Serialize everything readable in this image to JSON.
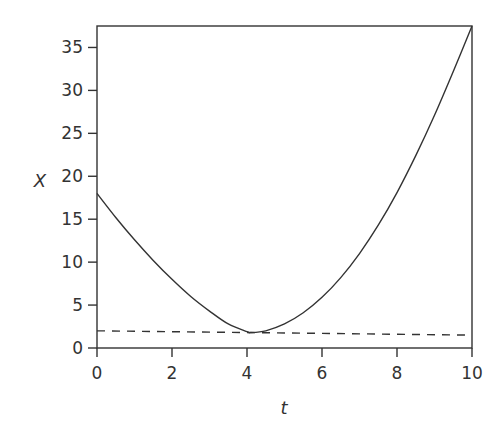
{
  "chart_data": {
    "type": "line",
    "title": "",
    "xlabel": "t",
    "ylabel": "X",
    "xlim": [
      0,
      10
    ],
    "ylim": [
      0,
      37.5
    ],
    "grid": false,
    "legend": null,
    "x_ticks": [
      "0",
      "2",
      "4",
      "6",
      "8",
      "10"
    ],
    "y_ticks": [
      "0",
      "5",
      "10",
      "15",
      "20",
      "25",
      "30",
      "35"
    ],
    "series": [
      {
        "name": "trajectory",
        "style": "solid",
        "x": [
          0,
          0.5,
          1,
          1.5,
          2,
          2.5,
          3,
          3.5,
          4,
          4.1,
          4.5,
          5,
          5.5,
          6,
          6.5,
          7,
          7.5,
          8,
          8.5,
          9,
          9.5,
          10
        ],
        "y": [
          18,
          15.2,
          12.6,
          10.2,
          8.0,
          6.0,
          4.3,
          2.8,
          1.9,
          1.8,
          2.0,
          2.8,
          4.1,
          5.9,
          8.2,
          11.0,
          14.3,
          18.1,
          22.4,
          27.1,
          32.2,
          37.5
        ]
      },
      {
        "name": "reference",
        "style": "dashed",
        "x": [
          0,
          10
        ],
        "y": [
          2.0,
          1.5
        ]
      }
    ]
  }
}
